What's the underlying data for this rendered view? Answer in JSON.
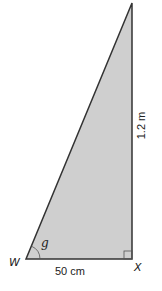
{
  "diagram": {
    "type": "right-triangle",
    "fill_color": "#cfcfcf",
    "stroke_color": "#333333",
    "vertices": {
      "W": {
        "label": "W"
      },
      "X": {
        "label": "X"
      },
      "top": {
        "label": ""
      }
    },
    "angle": {
      "label": "g",
      "at_vertex": "W"
    },
    "right_angle_at": "X",
    "sides": {
      "base": {
        "label": "50 cm"
      },
      "height": {
        "label": "1.2 m"
      }
    }
  }
}
